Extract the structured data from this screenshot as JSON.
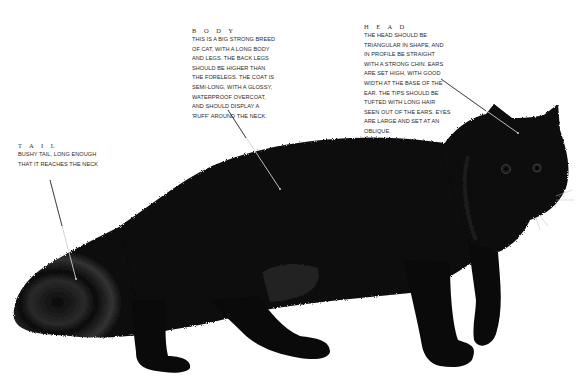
{
  "diagram": {
    "labels": {
      "head": {
        "title": "H E A D",
        "text": "THE HEAD SHOULD BE\nTRIANGULAR IN SHAPE, AND\nIN PROFILE BE STRAIGHT\nWITH A STRONG CHIN. EARS\nARE SET HIGH, WITH GOOD\nWIDTH AT THE BASE OF THE\nEAR. THE TIPS SHOULD BE\nTUFTED WITH LONG HAIR\nSEEN OUT OF THE EARS. EYES\nARE LARGE AND SET AT AN\nOBLIQUE."
      },
      "body": {
        "title": "B O D Y",
        "text": "THIS IS A BIG STRONG BREED\nOF CAT, WITH A LONG BODY\nAND LEGS. THE BACK LEGS\nSHOULD BE HIGHER THAN\nTHE FORELEGS. THE COAT IS\nSEMI-LONG, WITH A GLOSSY,\nWATERPROOF OVERCOAT,\nAND SHOULD DISPLAY A\n'RUFF' AROUND THE NECK."
      },
      "tail": {
        "title": "T A I L",
        "text": "BUSHY TAIL, LONG ENOUGH\nTHAT IT REACHES THE NECK"
      }
    },
    "leader_lines": [
      {
        "label": "head",
        "from": [
          441,
          79
        ],
        "to": [
          518,
          133
        ]
      },
      {
        "label": "body",
        "from": [
          228,
          110
        ],
        "to": [
          280,
          189
        ]
      },
      {
        "label": "tail",
        "from": [
          50,
          180
        ],
        "to": [
          76,
          279
        ]
      }
    ],
    "colors": {
      "background": "#ffffff",
      "cat_fur": "#0a0a0a",
      "fur_highlight": "#3a3a3a",
      "text": "#2a2a2a",
      "leader_line": "#cfcfcf"
    }
  }
}
